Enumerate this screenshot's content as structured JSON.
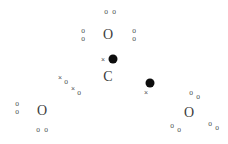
{
  "chart_data": {
    "type": "scatter",
    "title": "",
    "subtitle": "",
    "xlabel": "",
    "ylabel": "",
    "xlim": [
      0,
      228
    ],
    "ylim": [
      0,
      144
    ],
    "grid": false,
    "legend": null,
    "axes_visible": false,
    "background_color": "#ffffff",
    "marker_colors": {
      "open_circle": "#4a4a4a",
      "large_circle": "#3d3d3d",
      "cross": "#555555",
      "letter_c": "#3a3a3a",
      "filled_dot": "#0d0d0d"
    },
    "series": [
      {
        "name": "small-open-circle",
        "marker": "o",
        "points": [
          {
            "x": 106,
            "y": 12
          },
          {
            "x": 114,
            "y": 12
          },
          {
            "x": 83,
            "y": 31
          },
          {
            "x": 83,
            "y": 39
          },
          {
            "x": 134,
            "y": 31
          },
          {
            "x": 134,
            "y": 39
          },
          {
            "x": 66,
            "y": 82
          },
          {
            "x": 79,
            "y": 93
          },
          {
            "x": 17,
            "y": 104
          },
          {
            "x": 17,
            "y": 112
          },
          {
            "x": 38,
            "y": 130
          },
          {
            "x": 46,
            "y": 130
          },
          {
            "x": 191,
            "y": 93
          },
          {
            "x": 198,
            "y": 97
          },
          {
            "x": 172,
            "y": 126
          },
          {
            "x": 179,
            "y": 130
          },
          {
            "x": 210,
            "y": 124
          },
          {
            "x": 217,
            "y": 128
          }
        ]
      },
      {
        "name": "large-open-circle",
        "marker": "O",
        "points": [
          {
            "x": 108,
            "y": 35
          },
          {
            "x": 42,
            "y": 111
          },
          {
            "x": 189,
            "y": 113
          }
        ]
      },
      {
        "name": "cross",
        "marker": "x",
        "points": [
          {
            "x": 103,
            "y": 59
          },
          {
            "x": 60,
            "y": 77
          },
          {
            "x": 73,
            "y": 88
          },
          {
            "x": 146,
            "y": 92
          }
        ]
      },
      {
        "name": "letter-c",
        "marker": "C",
        "points": [
          {
            "x": 108,
            "y": 77
          }
        ]
      },
      {
        "name": "filled-dot",
        "marker": "filled-circle",
        "points": [
          {
            "x": 113,
            "y": 59
          },
          {
            "x": 150,
            "y": 83
          }
        ]
      }
    ],
    "glyph_labels": {
      "open_circle": "o",
      "large_circle": "O",
      "cross": "×",
      "letter_c": "C"
    }
  }
}
